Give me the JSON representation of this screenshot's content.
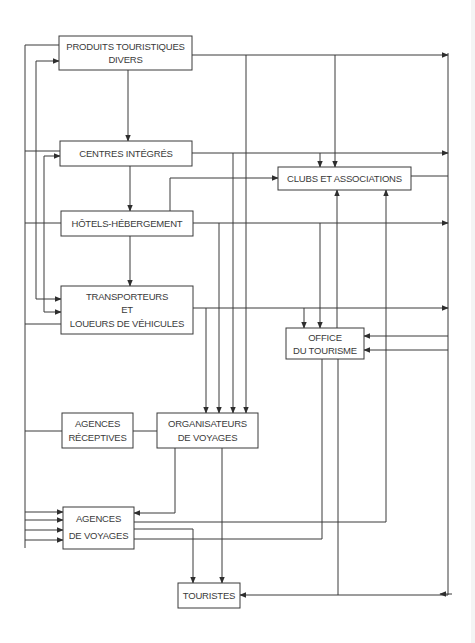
{
  "diagram": {
    "type": "flowchart",
    "background": "#ffffff",
    "line_color": "#3a3a3a",
    "nodes": {
      "produits": {
        "lines": [
          "PRODUITS TOURISTIQUES",
          "DIVERS"
        ]
      },
      "centres": {
        "lines": [
          "CENTRES INTÉGRÉS"
        ]
      },
      "clubs": {
        "lines": [
          "CLUBS ET ASSOCIATIONS"
        ]
      },
      "hotels": {
        "lines": [
          "HÔTELS-HÉBERGEMENT"
        ]
      },
      "transporteurs": {
        "lines": [
          "TRANSPORTEURS",
          "ET",
          "LOUEURS DE VÉHICULES"
        ]
      },
      "office": {
        "lines": [
          "OFFICE",
          "DU TOURISME"
        ]
      },
      "agences_receptives": {
        "lines": [
          "AGENCES",
          "RÉCEPTIVES"
        ]
      },
      "organisateurs": {
        "lines": [
          "ORGANISATEURS",
          "DE VOYAGES"
        ]
      },
      "agences_voyages": {
        "lines": [
          "AGENCES",
          "DE VOYAGES"
        ]
      },
      "touristes": {
        "lines": [
          "TOURISTES"
        ]
      }
    },
    "edges": [
      {
        "from": "PRODUITS TOURISTIQUES DIVERS",
        "to": "CENTRES INTÉGRÉS"
      },
      {
        "from": "CENTRES INTÉGRÉS",
        "to": "HÔTELS-HÉBERGEMENT"
      },
      {
        "from": "HÔTELS-HÉBERGEMENT",
        "to": "TRANSPORTEURS ET LOUEURS DE VÉHICULES"
      },
      {
        "from": "PRODUITS TOURISTIQUES DIVERS",
        "to": "CLUBS ET ASSOCIATIONS"
      },
      {
        "from": "CENTRES INTÉGRÉS",
        "to": "CLUBS ET ASSOCIATIONS"
      },
      {
        "from": "HÔTELS-HÉBERGEMENT",
        "to": "CLUBS ET ASSOCIATIONS"
      },
      {
        "from": "HÔTELS-HÉBERGEMENT",
        "to": "OFFICE DU TOURISME"
      },
      {
        "from": "TRANSPORTEURS ET LOUEURS DE VÉHICULES",
        "to": "OFFICE DU TOURISME"
      },
      {
        "from": "PRODUITS TOURISTIQUES DIVERS",
        "to": "ORGANISATEURS DE VOYAGES"
      },
      {
        "from": "CENTRES INTÉGRÉS",
        "to": "ORGANISATEURS DE VOYAGES"
      },
      {
        "from": "HÔTELS-HÉBERGEMENT",
        "to": "ORGANISATEURS DE VOYAGES"
      },
      {
        "from": "TRANSPORTEURS ET LOUEURS DE VÉHICULES",
        "to": "ORGANISATEURS DE VOYAGES"
      },
      {
        "from": "AGENCES RÉCEPTIVES",
        "to": "ORGANISATEURS DE VOYAGES"
      },
      {
        "from": "ORGANISATEURS DE VOYAGES",
        "to": "AGENCES DE VOYAGES"
      },
      {
        "from": "ORGANISATEURS DE VOYAGES",
        "to": "TOURISTES"
      },
      {
        "from": "AGENCES DE VOYAGES",
        "to": "TOURISTES"
      },
      {
        "from": "AGENCES DE VOYAGES",
        "to": "CLUBS ET ASSOCIATIONS"
      },
      {
        "from": "AGENCES DE VOYAGES",
        "to": "OFFICE DU TOURISME"
      },
      {
        "from": "OFFICE DU TOURISME",
        "to": "TOURISTES"
      },
      {
        "from": "CLUBS ET ASSOCIATIONS",
        "to": "TOURISTES"
      },
      {
        "from": "PRODUITS/CENTRES/HÔTELS/TRANSPORTEURS (right bus)",
        "to": "TOURISTES"
      },
      {
        "from": "right bus",
        "to": "OFFICE DU TOURISME"
      },
      {
        "from": "left bus",
        "to": "AGENCES DE VOYAGES"
      },
      {
        "from": "left bus",
        "to": "TRANSPORTEURS ET LOUEURS DE VÉHICULES"
      },
      {
        "from": "left bus",
        "to": "PRODUITS TOURISTIQUES DIVERS"
      },
      {
        "from": "left bus",
        "to": "CENTRES INTÉGRÉS"
      }
    ]
  }
}
